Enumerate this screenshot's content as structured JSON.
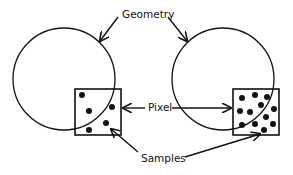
{
  "diagram": {
    "labels": {
      "geometry": "Geometry",
      "pixel": "Pixel",
      "samples": "Samples"
    },
    "colors": {
      "stroke": "#111111",
      "background": "#ffffff"
    },
    "panels": [
      {
        "name": "sparse-sampling",
        "circle": {
          "cx": 64,
          "cy": 79,
          "r": 51
        },
        "pixel_box": {
          "x": 75,
          "y": 89,
          "w": 46,
          "h": 46
        },
        "sample_count": 6,
        "samples": [
          [
            82,
            95
          ],
          [
            89,
            111
          ],
          [
            112,
            107
          ],
          [
            89,
            130
          ],
          [
            106,
            124
          ],
          [
            106,
            124
          ]
        ]
      },
      {
        "name": "dense-sampling",
        "circle": {
          "cx": 223,
          "cy": 79,
          "r": 51
        },
        "pixel_box": {
          "x": 233,
          "y": 89,
          "w": 46,
          "h": 46
        },
        "sample_count": 16,
        "samples": [
          [
            242,
            98
          ],
          [
            255,
            95
          ],
          [
            267,
            97
          ],
          [
            240,
            111
          ],
          [
            251,
            112
          ],
          [
            262,
            104
          ],
          [
            273,
            109
          ],
          [
            241,
            125
          ],
          [
            258,
            124
          ],
          [
            266,
            118
          ],
          [
            271,
            127
          ],
          [
            264,
            130
          ],
          [
            253,
            128
          ],
          [
            246,
            125
          ],
          [
            248,
            97
          ],
          [
            275,
            100
          ]
        ]
      }
    ]
  }
}
